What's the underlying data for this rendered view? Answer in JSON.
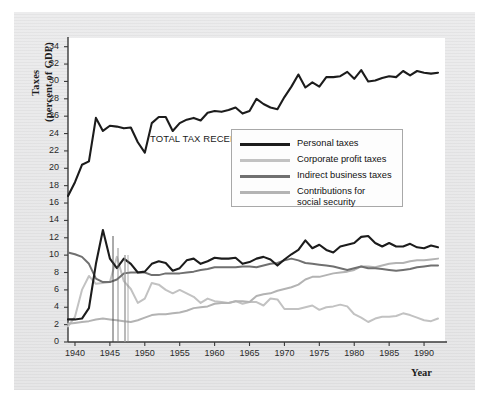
{
  "figure": {
    "y_axis_label_line1": "Taxes",
    "y_axis_label_line2": "(percent of GDP)",
    "x_axis_label": "Year",
    "annotation": "TOTAL TAX\nRECEIPTS"
  },
  "legend": {
    "items": [
      {
        "label": "Personal taxes",
        "color": "#1c1c1c"
      },
      {
        "label": "Corporate profit taxes",
        "color": "#c2c2c2"
      },
      {
        "label": "Indirect business taxes",
        "color": "#707070"
      },
      {
        "label": "Contributions for\nsocial security",
        "color": "#b3b3b3"
      }
    ]
  },
  "chart_data": {
    "type": "line",
    "title": "",
    "xlabel": "Year",
    "ylabel": "Taxes (percent of GDP)",
    "xlim": [
      1939,
      1993
    ],
    "ylim": [
      0,
      35
    ],
    "yticks": [
      0,
      2,
      4,
      6,
      8,
      10,
      12,
      14,
      16,
      18,
      20,
      22,
      24,
      26,
      28,
      30,
      32,
      34
    ],
    "xticks": [
      1940,
      1945,
      1950,
      1955,
      1960,
      1965,
      1970,
      1975,
      1980,
      1985,
      1990
    ],
    "grid": false,
    "legend_position": "upper-center-right",
    "annotations": [
      {
        "text": "TOTAL TAX RECEIPTS",
        "x": 1951,
        "y": 23
      }
    ],
    "x": [
      1939,
      1940,
      1941,
      1942,
      1943,
      1944,
      1945,
      1946,
      1947,
      1948,
      1949,
      1950,
      1951,
      1952,
      1953,
      1954,
      1955,
      1956,
      1957,
      1958,
      1959,
      1960,
      1961,
      1962,
      1963,
      1964,
      1965,
      1966,
      1967,
      1968,
      1969,
      1970,
      1971,
      1972,
      1973,
      1974,
      1975,
      1976,
      1977,
      1978,
      1979,
      1980,
      1981,
      1982,
      1983,
      1984,
      1985,
      1986,
      1987,
      1988,
      1989,
      1990,
      1991,
      1992
    ],
    "series": [
      {
        "name": "Total tax receipts",
        "color": "#1c1c1c",
        "width": 2.1,
        "values": [
          16.8,
          18.4,
          20.4,
          20.8,
          25.8,
          24.3,
          24.9,
          24.8,
          24.6,
          24.7,
          23.0,
          21.8,
          25.2,
          25.9,
          25.9,
          24.3,
          25.2,
          25.6,
          25.8,
          25.5,
          26.4,
          26.6,
          26.5,
          26.7,
          27.0,
          26.3,
          26.6,
          28.0,
          27.4,
          27.0,
          26.8,
          28.2,
          29.4,
          30.8,
          29.3,
          29.9,
          29.4,
          30.5,
          30.5,
          30.6,
          31.1,
          30.3,
          31.3,
          30.0,
          30.1,
          30.4,
          30.6,
          30.5,
          31.2,
          30.7,
          31.2,
          31.0,
          30.9,
          31.0
        ]
      },
      {
        "name": "Personal taxes",
        "color": "#1c1c1c",
        "width": 2.1,
        "values": [
          2.6,
          2.6,
          2.7,
          3.9,
          9.0,
          12.9,
          9.6,
          8.5,
          9.6,
          9.0,
          8.0,
          8.1,
          9.0,
          9.3,
          9.1,
          8.2,
          8.5,
          9.4,
          9.6,
          9.0,
          9.3,
          9.7,
          9.6,
          9.6,
          9.7,
          9.0,
          9.2,
          9.6,
          9.8,
          9.5,
          8.8,
          9.5,
          10.1,
          10.6,
          11.7,
          10.8,
          11.2,
          10.6,
          10.3,
          11.0,
          11.2,
          11.4,
          12.1,
          12.2,
          11.4,
          11.0,
          11.4,
          11.0,
          11.0,
          11.3,
          10.9,
          10.8,
          11.1,
          10.9
        ]
      },
      {
        "name": "Corporate profit taxes",
        "color": "#c2c2c2",
        "width": 2.0,
        "values": [
          1.8,
          2.9,
          6.0,
          7.6,
          6.7,
          6.8,
          6.9,
          9.8,
          7.0,
          6.1,
          4.5,
          5.0,
          6.8,
          6.6,
          6.0,
          5.6,
          6.0,
          5.6,
          5.2,
          4.5,
          5.0,
          4.7,
          4.6,
          4.5,
          4.7,
          4.4,
          4.6,
          4.6,
          4.2,
          5.0,
          4.9,
          3.8,
          3.8,
          3.8,
          4.0,
          4.2,
          3.7,
          4.0,
          4.1,
          4.3,
          4.1,
          3.2,
          2.8,
          2.3,
          2.7,
          2.9,
          2.9,
          3.0,
          3.3,
          3.1,
          2.8,
          2.5,
          2.4,
          2.7
        ]
      },
      {
        "name": "Indirect business taxes",
        "color": "#707070",
        "width": 2.0,
        "values": [
          10.3,
          10.1,
          9.8,
          9.0,
          7.3,
          6.9,
          6.9,
          7.2,
          7.9,
          8.0,
          8.0,
          8.0,
          7.7,
          7.7,
          7.9,
          7.9,
          7.9,
          8.0,
          8.1,
          8.3,
          8.4,
          8.6,
          8.6,
          8.6,
          8.6,
          8.7,
          8.7,
          8.6,
          8.8,
          9.0,
          9.1,
          9.4,
          9.6,
          9.4,
          9.1,
          9.0,
          8.9,
          8.8,
          8.7,
          8.5,
          8.3,
          8.5,
          8.7,
          8.5,
          8.5,
          8.4,
          8.3,
          8.2,
          8.3,
          8.4,
          8.6,
          8.7,
          8.8,
          8.8
        ]
      },
      {
        "name": "Contributions for social security",
        "color": "#b3b3b3",
        "width": 2.0,
        "values": [
          2.1,
          2.2,
          2.3,
          2.4,
          2.6,
          2.7,
          2.6,
          2.5,
          2.4,
          2.3,
          2.5,
          2.8,
          3.1,
          3.2,
          3.2,
          3.3,
          3.4,
          3.6,
          3.9,
          4.0,
          4.1,
          4.4,
          4.5,
          4.5,
          4.7,
          4.7,
          4.6,
          5.3,
          5.5,
          5.6,
          5.9,
          6.1,
          6.3,
          6.6,
          7.2,
          7.5,
          7.5,
          7.7,
          7.9,
          8.0,
          8.1,
          8.3,
          8.7,
          8.7,
          8.6,
          8.8,
          9.0,
          9.1,
          9.1,
          9.3,
          9.4,
          9.4,
          9.5,
          9.6
        ]
      }
    ]
  }
}
